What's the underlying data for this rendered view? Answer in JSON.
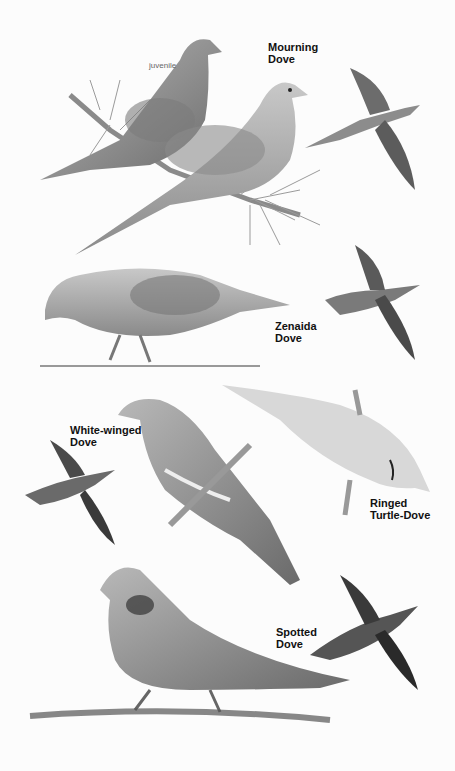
{
  "plate": {
    "species": [
      {
        "name": "Mourning\nDove",
        "note": "juvenile"
      },
      {
        "name": "Zenaida\nDove"
      },
      {
        "name": "White-winged\nDove"
      },
      {
        "name": "Ringed\nTurtle-Dove"
      },
      {
        "name": "Spotted\nDove"
      }
    ]
  }
}
